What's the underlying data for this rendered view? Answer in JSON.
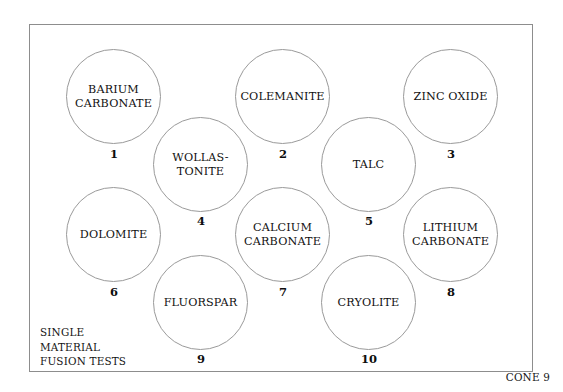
{
  "figure": {
    "caption": "SINGLE\nMATERIAL\nFUSION TESTS",
    "cone_label": "CONE 9",
    "frame_color": "#8d8d8d",
    "circle_color": "#9a9a9a",
    "background_color": "#ffffff",
    "text_color": "#111111"
  },
  "chart_data": {
    "type": "diagram",
    "title": "SINGLE MATERIAL FUSION TESTS",
    "annotation": "CONE 9",
    "layout": "staggered grid of 10 circular test tiles, numbered 1-10",
    "categories": [
      "BARIUM CARBONATE",
      "COLEMANITE",
      "ZINC OXIDE",
      "WOLLASTONITE",
      "TALC",
      "DOLOMITE",
      "CALCIUM CARBONATE",
      "LITHIUM CARBONATE",
      "FLUORSPAR",
      "CRYOLITE"
    ],
    "values": [
      1,
      2,
      3,
      4,
      5,
      6,
      7,
      8,
      9,
      10
    ]
  },
  "tests": [
    {
      "number": "1",
      "label": "BARIUM\nCARBONATE",
      "left": 66,
      "top": 49,
      "size": 95,
      "num_left": 101,
      "num_top": 147
    },
    {
      "number": "2",
      "label": "COLEMANITE",
      "left": 235,
      "top": 49,
      "size": 95,
      "num_left": 270,
      "num_top": 147
    },
    {
      "number": "3",
      "label": "ZINC OXIDE",
      "left": 403,
      "top": 49,
      "size": 95,
      "num_left": 438,
      "num_top": 147
    },
    {
      "number": "4",
      "label": "WOLLAS-\nTONITE",
      "left": 153,
      "top": 117,
      "size": 95,
      "num_left": 188,
      "num_top": 214
    },
    {
      "number": "5",
      "label": "TALC",
      "left": 321,
      "top": 117,
      "size": 95,
      "num_left": 356,
      "num_top": 214
    },
    {
      "number": "6",
      "label": "DOLOMITE",
      "left": 66,
      "top": 187,
      "size": 95,
      "num_left": 101,
      "num_top": 285
    },
    {
      "number": "7",
      "label": "CALCIUM\nCARBONATE",
      "left": 235,
      "top": 187,
      "size": 95,
      "num_left": 270,
      "num_top": 285
    },
    {
      "number": "8",
      "label": "LITHIUM\nCARBONATE",
      "left": 403,
      "top": 187,
      "size": 95,
      "num_left": 438,
      "num_top": 285
    },
    {
      "number": "9",
      "label": "FLUORSPAR",
      "left": 153,
      "top": 255,
      "size": 95,
      "num_left": 188,
      "num_top": 352
    },
    {
      "number": "10",
      "label": "CRYOLITE",
      "left": 321,
      "top": 255,
      "size": 95,
      "num_left": 356,
      "num_top": 352
    }
  ]
}
